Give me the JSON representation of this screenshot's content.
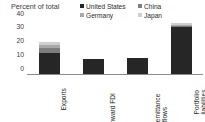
{
  "chart_data": {
    "type": "bar",
    "title": "",
    "ylabel": "Percent of total",
    "xlabel": "",
    "ylim": [
      0,
      40
    ],
    "yticks": [
      0,
      10,
      20,
      30,
      40
    ],
    "ytick_labels": [
      "0",
      "10",
      "20",
      "30",
      "40"
    ],
    "grid": false,
    "stacked": true,
    "legend_position": "top-right",
    "categories": [
      "Exports",
      "Inward FDI",
      "Remittance inflows",
      "Portfolio liabilities"
    ],
    "category_lines": [
      [
        "Exports"
      ],
      [
        "Inward FDI"
      ],
      [
        "Remittance",
        "inflows"
      ],
      [
        "Portfolio",
        "liabilities"
      ]
    ],
    "series": [
      {
        "name": "United States",
        "color": "#262626",
        "values": [
          15.2,
          11.0,
          12.0,
          34.2
        ]
      },
      {
        "name": "China",
        "color": "#7d7d7d",
        "values": [
          3.4,
          0.0,
          0.0,
          0.7
        ]
      },
      {
        "name": "Germany",
        "color": "#a8a8a8",
        "values": [
          2.6,
          0.0,
          0.0,
          0.8
        ]
      },
      {
        "name": "Japan",
        "color": "#cfcfcf",
        "values": [
          2.1,
          0.0,
          0.0,
          1.1
        ]
      }
    ],
    "totals": [
      23.3,
      11.0,
      12.0,
      36.8
    ]
  },
  "legend": {
    "entries": [
      {
        "label": "United States",
        "color": "#262626"
      },
      {
        "label": "China",
        "color": "#7d7d7d"
      },
      {
        "label": "Germany",
        "color": "#a8a8a8"
      },
      {
        "label": "Japan",
        "color": "#cfcfcf"
      }
    ]
  },
  "axes": {
    "y_title": "Percent of total"
  },
  "colors": {
    "background": "#ffffff",
    "axis_line": "#8a8a8a",
    "text": "#2b2b2b"
  }
}
